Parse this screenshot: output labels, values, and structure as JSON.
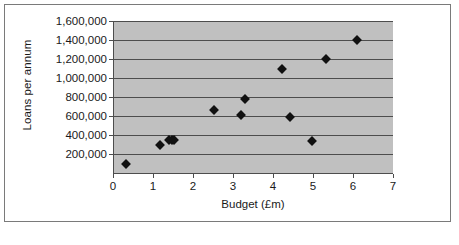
{
  "chart_data": {
    "type": "scatter",
    "title": "",
    "xlabel": "Budget (£m)",
    "ylabel": "Loans per annum",
    "xlim": [
      0,
      7
    ],
    "ylim": [
      0,
      1600000
    ],
    "xticks": [
      "0",
      "1",
      "2",
      "3",
      "4",
      "5",
      "6",
      "7"
    ],
    "xtick_values": [
      0,
      1,
      2,
      3,
      4,
      5,
      6,
      7
    ],
    "yticks": [
      "200,000",
      "400,000",
      "600,000",
      "800,000",
      "1,000,000",
      "1,200,000",
      "1,400,000",
      "1,600,000"
    ],
    "ytick_values": [
      200000,
      400000,
      600000,
      800000,
      1000000,
      1200000,
      1400000,
      1600000
    ],
    "grid": "horizontal",
    "legend": "none",
    "plot_background": "#c0c0c0",
    "marker_color": "#111111",
    "marker_shape": "diamond",
    "gridline_color": "#4d4d4d",
    "points": [
      {
        "x": 0.3,
        "y": 90000
      },
      {
        "x": 1.15,
        "y": 290000
      },
      {
        "x": 1.37,
        "y": 345000
      },
      {
        "x": 1.45,
        "y": 350000
      },
      {
        "x": 1.5,
        "y": 345000
      },
      {
        "x": 2.5,
        "y": 660000
      },
      {
        "x": 3.17,
        "y": 610000
      },
      {
        "x": 3.27,
        "y": 775000
      },
      {
        "x": 4.2,
        "y": 1100000
      },
      {
        "x": 4.4,
        "y": 590000
      },
      {
        "x": 4.95,
        "y": 335000
      },
      {
        "x": 5.3,
        "y": 1195000
      },
      {
        "x": 6.07,
        "y": 1400000
      }
    ]
  }
}
